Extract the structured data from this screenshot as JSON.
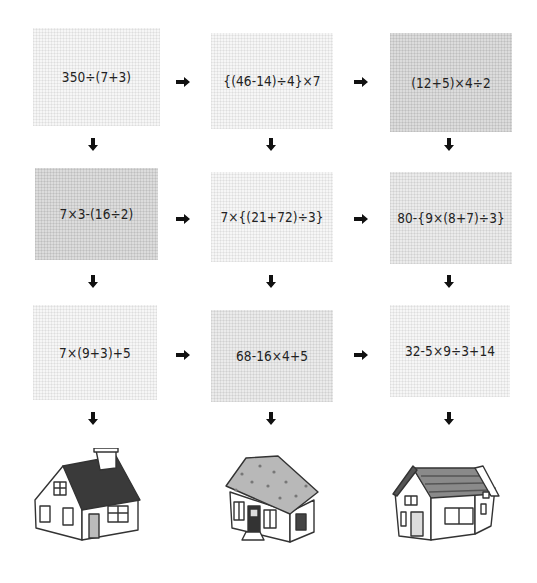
{
  "puzzle": {
    "rows": [
      {
        "cells": [
          {
            "expression": "350÷(7+3)",
            "shade": "light"
          },
          {
            "expression": "{(46-14)÷4}×7",
            "shade": "light"
          },
          {
            "expression": "(12+5)×4÷2",
            "shade": "dark"
          }
        ]
      },
      {
        "cells": [
          {
            "expression": "7×3-(16÷2)",
            "shade": "dark"
          },
          {
            "expression": "7×{(21+72)÷3}",
            "shade": "light"
          },
          {
            "expression": "80-{9×(8+7)÷3}",
            "shade": "mid"
          }
        ]
      },
      {
        "cells": [
          {
            "expression": "7×(9+3)+5",
            "shade": "light"
          },
          {
            "expression": "68-16×4+5",
            "shade": "mid"
          },
          {
            "expression": "32-5×9÷3+14",
            "shade": "light"
          }
        ]
      }
    ],
    "arrows": {
      "right": "right-arrow",
      "down": "down-arrow"
    },
    "houses": [
      {
        "name": "house-with-chimney",
        "roof": "dark-gray shingled gable roof"
      },
      {
        "name": "house-hipped-roof",
        "roof": "light-gray dotted hipped roof"
      },
      {
        "name": "house-cross-gable",
        "roof": "gray striped cross-gable roof"
      }
    ]
  }
}
